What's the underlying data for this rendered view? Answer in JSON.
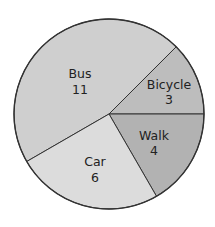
{
  "chart_data": {
    "type": "pie",
    "title": "",
    "categories": [
      "Bus",
      "Bicycle",
      "Walk",
      "Car"
    ],
    "values": [
      11,
      3,
      4,
      6
    ],
    "total": 24,
    "slices": [
      {
        "label": "Bus",
        "value": 11,
        "start_angle": 150,
        "end_angle": 315,
        "color": "#cfcfcf",
        "label_pos": [
          80,
          78
        ],
        "value_pos": [
          80,
          94
        ]
      },
      {
        "label": "Bicycle",
        "value": 3,
        "start_angle": -45,
        "end_angle": 0,
        "color": "#bdbdbd",
        "label_pos": [
          169,
          89
        ],
        "value_pos": [
          169,
          104
        ]
      },
      {
        "label": "Walk",
        "value": 4,
        "start_angle": 0,
        "end_angle": 60,
        "color": "#b2b2b2",
        "label_pos": [
          154,
          140
        ],
        "value_pos": [
          154,
          155
        ]
      },
      {
        "label": "Car",
        "value": 6,
        "start_angle": 60,
        "end_angle": 150,
        "color": "#dcdcdc",
        "label_pos": [
          95,
          166
        ],
        "value_pos": [
          95,
          182
        ]
      }
    ],
    "center": [
      109,
      114
    ],
    "radius": 95,
    "stroke_color": "#333333",
    "legend": "none (labels inside slices)"
  }
}
